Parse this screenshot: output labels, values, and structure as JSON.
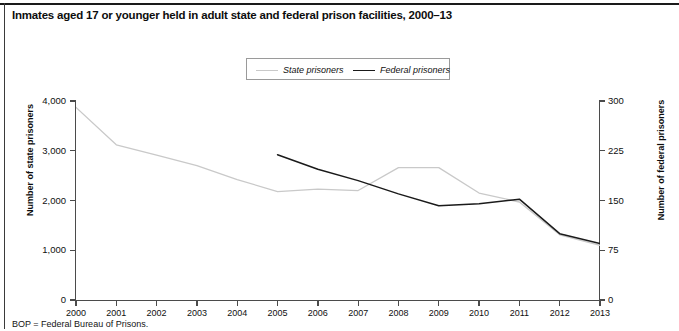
{
  "figure": {
    "title": "Inmates aged 17 or younger held in adult state and federal prison facilities, 2000–13",
    "footnote": "BOP = Federal Bureau of Prisons."
  },
  "legend": {
    "state_label": "State prisoners",
    "federal_label": "Federal prisoners",
    "state_color": "#c9c9c9",
    "federal_color": "#1a1a1a"
  },
  "chart_data": {
    "type": "line",
    "title": "Inmates aged 17 or younger held in adult state and federal prison facilities, 2000–13",
    "xlabel": "",
    "ylabel": "Number of state prisoners",
    "y2label": "Number of federal prisoners",
    "grid": false,
    "legend_position": "top-center",
    "x": [
      2000,
      2001,
      2002,
      2003,
      2004,
      2005,
      2006,
      2007,
      2008,
      2009,
      2010,
      2011,
      2012,
      2013
    ],
    "categories": [
      "2000",
      "2001",
      "2002",
      "2003",
      "2004",
      "2005",
      "2006",
      "2007",
      "2008",
      "2009",
      "2010",
      "2011",
      "2012",
      "2013"
    ],
    "ylim": [
      0,
      4000
    ],
    "yticks": [
      0,
      1000,
      2000,
      3000,
      4000
    ],
    "ytick_labels": [
      "0",
      "1,000",
      "2,000",
      "3,000",
      "4,000"
    ],
    "y2lim": [
      0,
      300
    ],
    "y2ticks": [
      0,
      75,
      150,
      225,
      300
    ],
    "y2tick_labels": [
      "0",
      "75",
      "150",
      "225",
      "300"
    ],
    "series": [
      {
        "name": "State prisoners",
        "axis": "left",
        "color": "#c9c9c9",
        "x": [
          2000,
          2001,
          2002,
          2003,
          2004,
          2005,
          2006,
          2007,
          2008,
          2009,
          2010,
          2011,
          2012,
          2013
        ],
        "values": [
          3870,
          3120,
          2910,
          2700,
          2420,
          2180,
          2230,
          2200,
          2660,
          2660,
          2150,
          1970,
          1310,
          1100
        ]
      },
      {
        "name": "Federal prisoners",
        "axis": "right",
        "color": "#1a1a1a",
        "x": [
          2005,
          2006,
          2007,
          2008,
          2009,
          2010,
          2011,
          2012,
          2013
        ],
        "values": [
          219,
          197,
          180,
          160,
          142,
          145,
          152,
          100,
          85
        ]
      }
    ]
  },
  "axes": {
    "left_title": "Number of state prisoners",
    "right_title": "Number of federal prisoners"
  }
}
